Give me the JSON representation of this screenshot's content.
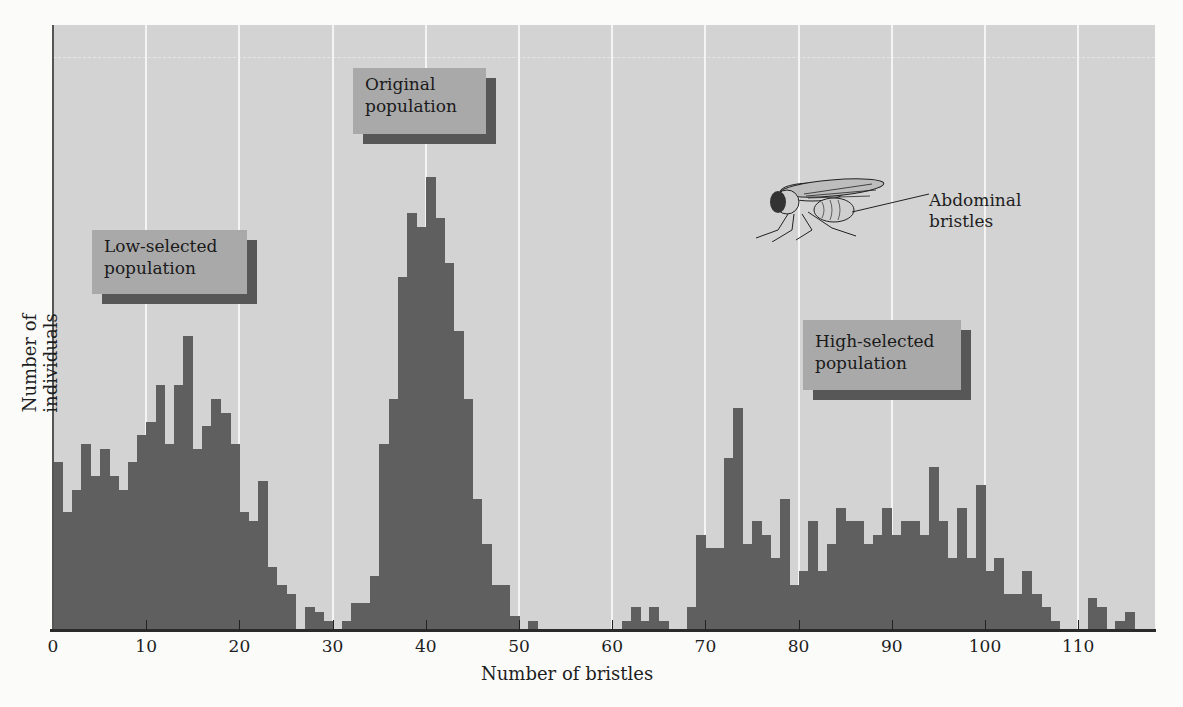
{
  "chart_data": {
    "type": "bar",
    "subtype": "histogram",
    "title": "",
    "xlabel": "Number of bristles",
    "ylabel": "Number of individuals",
    "xlim": [
      0,
      118
    ],
    "ylim": [
      0,
      133
    ],
    "y_scale_note": "relative height (tallest bar = 100); y-axis has no tick labels",
    "x_ticks": [
      0,
      10,
      20,
      30,
      40,
      50,
      60,
      70,
      80,
      90,
      100,
      110
    ],
    "grid": {
      "vertical_at_ticks": true,
      "horizontal": false
    },
    "bin_width": 1,
    "x": [
      0,
      1,
      2,
      3,
      4,
      5,
      6,
      7,
      8,
      9,
      10,
      11,
      12,
      13,
      14,
      15,
      16,
      17,
      18,
      19,
      20,
      21,
      22,
      23,
      24,
      25,
      26,
      27,
      28,
      29,
      30,
      31,
      32,
      33,
      34,
      35,
      36,
      37,
      38,
      39,
      40,
      41,
      42,
      43,
      44,
      45,
      46,
      47,
      48,
      49,
      50,
      51,
      52,
      53,
      54,
      55,
      56,
      57,
      58,
      59,
      60,
      61,
      62,
      63,
      64,
      65,
      66,
      67,
      68,
      69,
      70,
      71,
      72,
      73,
      74,
      75,
      76,
      77,
      78,
      79,
      80,
      81,
      82,
      83,
      84,
      85,
      86,
      87,
      88,
      89,
      90,
      91,
      92,
      93,
      94,
      95,
      96,
      97,
      98,
      99,
      100,
      101,
      102,
      103,
      104,
      105,
      106,
      107,
      108,
      109,
      110,
      111,
      112,
      113,
      114,
      115
    ],
    "values": [
      37,
      26,
      31,
      41,
      34,
      40,
      34,
      31,
      37,
      43,
      46,
      54,
      41,
      54,
      65,
      40,
      45,
      51,
      48,
      41,
      26,
      24,
      33,
      14,
      10,
      8,
      0,
      5,
      4,
      2,
      0,
      2,
      6,
      6,
      12,
      41,
      51,
      78,
      92,
      89,
      100,
      91,
      81,
      66,
      51,
      29,
      19,
      10,
      10,
      3,
      0,
      2,
      0,
      0,
      0,
      0,
      0,
      0,
      0,
      0,
      0,
      2,
      5,
      2,
      5,
      2,
      0,
      0,
      5,
      21,
      18,
      18,
      38,
      49,
      19,
      24,
      21,
      16,
      29,
      10,
      13,
      24,
      13,
      19,
      27,
      24,
      24,
      19,
      21,
      27,
      21,
      24,
      24,
      21,
      36,
      24,
      16,
      27,
      16,
      32,
      13,
      16,
      8,
      8,
      13,
      8,
      5,
      2,
      0,
      0,
      0,
      7,
      5,
      0,
      2,
      4
    ],
    "annotations": [
      {
        "text": "Low-selected population",
        "near_x": 15
      },
      {
        "text": "Original population",
        "near_x": 40
      },
      {
        "text": "High-selected population",
        "near_x": 90
      },
      {
        "text": "Abdominal bristles",
        "note": "label pointing to fruit fly illustration"
      }
    ],
    "colors": {
      "bars": "#5f5f5f",
      "background": "#d3d3d3",
      "label_box": "#a9a9a9",
      "label_shadow": "#575757"
    }
  },
  "labels": {
    "low": [
      "Low-selected",
      "population"
    ],
    "original": [
      "Original",
      "population"
    ],
    "high": [
      "High-selected",
      "population"
    ],
    "abdominal": [
      "Abdominal",
      "bristles"
    ]
  },
  "axis": {
    "xlabel": "Number of bristles",
    "ylabel": "Number of individuals",
    "ticks": [
      "0",
      "10",
      "20",
      "30",
      "40",
      "50",
      "60",
      "70",
      "80",
      "90",
      "100",
      "110"
    ]
  }
}
